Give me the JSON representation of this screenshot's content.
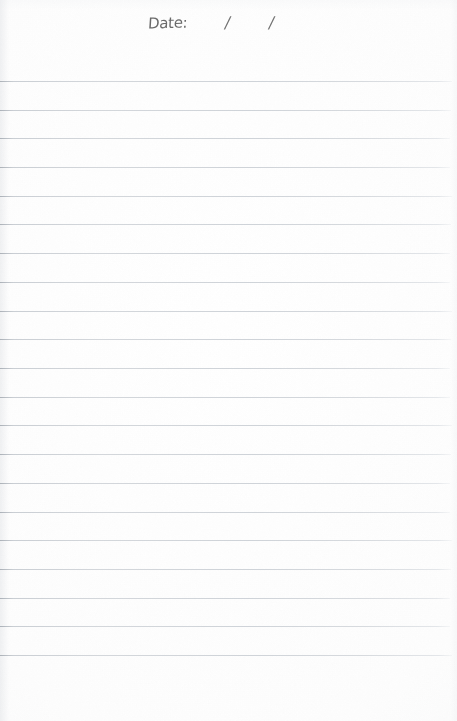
{
  "page": {
    "kind": "lined-notebook-page",
    "width": 457,
    "height": 721,
    "background_color": "#fdfdfd"
  },
  "header": {
    "date_label": "Date:",
    "separator_1": "/",
    "separator_2": "/",
    "ink_color": "#4a4a4a",
    "style": "handwritten"
  },
  "ruling": {
    "line_color": "#c8ccd0",
    "line_count": 21,
    "first_line_y": 81,
    "line_spacing": 28.7,
    "line_left_x": 0,
    "line_right_x": 452,
    "line_thickness": 1,
    "line_ys": [
      81,
      110,
      138,
      167,
      196,
      224,
      253,
      282,
      311,
      339,
      368,
      397,
      425,
      454,
      483,
      512,
      540,
      569,
      598,
      626,
      655
    ],
    "writing_lines_content": [
      "",
      "",
      "",
      "",
      "",
      "",
      "",
      "",
      "",
      "",
      "",
      "",
      "",
      "",
      "",
      "",
      "",
      "",
      "",
      "",
      ""
    ]
  }
}
